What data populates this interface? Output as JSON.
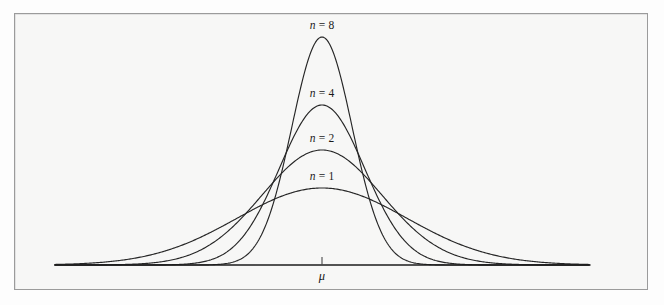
{
  "figure": {
    "background_color": "#fdfdfd",
    "frame": {
      "fill_color": "#f7f7f6",
      "border_color": "#9b9b9b",
      "x": 14,
      "y": 13,
      "width": 634,
      "height": 277
    }
  },
  "chart_data": {
    "type": "line",
    "title": "",
    "subtitle": "",
    "xlabel": "",
    "ylabel": "",
    "grid": false,
    "legend_position": "inline-above-peak",
    "axis": {
      "baseline_y_px": 265,
      "x_start_px": 55,
      "x_end_px": 590,
      "center_x_px": 322,
      "tick_label": "μ",
      "tick_value_label": "mu",
      "x_range_units": [
        -4.6,
        4.6
      ],
      "y_range_units": [
        0,
        1.05
      ]
    },
    "series": [
      {
        "name": "n = 1",
        "n": 1,
        "label": "n = 1",
        "label_symbol": "n",
        "label_value": "1",
        "sigma_px": 85.0,
        "peak_height_px": 77,
        "peak_top_y_px": 188,
        "label_x_px": 322,
        "label_y_px": 170,
        "color": "#262626",
        "relative_peak": 1.0,
        "relative_spread": 1.0
      },
      {
        "name": "n = 2",
        "n": 2,
        "label": "n = 2",
        "label_symbol": "n",
        "label_value": "2",
        "sigma_px": 60.1,
        "peak_height_px": 115,
        "peak_top_y_px": 150,
        "label_x_px": 322,
        "label_y_px": 132,
        "color": "#262626",
        "relative_peak": 1.414,
        "relative_spread": 0.707
      },
      {
        "name": "n = 4",
        "n": 4,
        "label": "n = 4",
        "label_symbol": "n",
        "label_value": "4",
        "sigma_px": 42.5,
        "peak_height_px": 160,
        "peak_top_y_px": 105,
        "label_x_px": 322,
        "label_y_px": 87,
        "color": "#262626",
        "relative_peak": 2.0,
        "relative_spread": 0.5
      },
      {
        "name": "n = 8",
        "n": 8,
        "label": "n = 8",
        "label_symbol": "n",
        "label_value": "8",
        "sigma_px": 30.1,
        "peak_height_px": 228,
        "peak_top_y_px": 37,
        "label_x_px": 322,
        "label_y_px": 19,
        "color": "#262626",
        "relative_peak": 2.828,
        "relative_spread": 0.354
      }
    ],
    "annotations": [
      {
        "text": "n = 8",
        "x_px": 322,
        "y_px": 19
      },
      {
        "text": "n = 4",
        "x_px": 322,
        "y_px": 87
      },
      {
        "text": "n = 2",
        "x_px": 322,
        "y_px": 132
      },
      {
        "text": "n = 1",
        "x_px": 322,
        "y_px": 170
      },
      {
        "text": "μ",
        "x_px": 322,
        "y_px": 270
      }
    ]
  },
  "labels": {
    "n8": {
      "symbol": "n",
      "equals": " = ",
      "value": "8"
    },
    "n4": {
      "symbol": "n",
      "equals": " = ",
      "value": "4"
    },
    "n2": {
      "symbol": "n",
      "equals": " = ",
      "value": "2"
    },
    "n1": {
      "symbol": "n",
      "equals": " = ",
      "value": "1"
    },
    "mu": "μ"
  }
}
